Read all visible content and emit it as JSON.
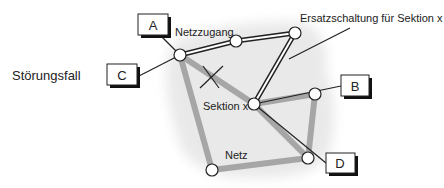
{
  "diagram": {
    "title_label": "Störungsfall",
    "access_label": "Netzzugang",
    "replacement_label": "Ersatzschaltung für Sektion x",
    "section_label": "Sektion x",
    "network_label": "Netz",
    "endpoints": [
      {
        "id": "A",
        "label": "A"
      },
      {
        "id": "B",
        "label": "B"
      },
      {
        "id": "C",
        "label": "C"
      },
      {
        "id": "D",
        "label": "D"
      }
    ],
    "colors": {
      "network_link": "#a6a6a6",
      "cloud": "#e9e9e9",
      "line": "#222222",
      "box_shadow": "#111111"
    }
  }
}
